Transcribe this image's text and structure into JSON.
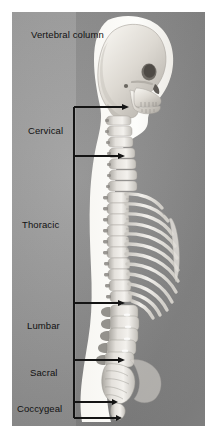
{
  "figure": {
    "title": "Vertebral column",
    "background_left_color": "#9b9b9b",
    "background_right_color": "#8a8a8a",
    "bone_color": "#e8e6e1",
    "silhouette_color": "#fdfdfb",
    "line_color": "#1a1a1a"
  },
  "regions": [
    {
      "key": "cervical",
      "label": "Cervical",
      "vertebrae": 7,
      "bracket_top": 95,
      "bracket_bottom": 144
    },
    {
      "key": "thoracic",
      "label": "Thoracic",
      "vertebrae": 12,
      "bracket_top": 144,
      "bracket_bottom": 291
    },
    {
      "key": "lumbar",
      "label": "Lumbar",
      "vertebrae": 5,
      "bracket_top": 291,
      "bracket_bottom": 348
    },
    {
      "key": "sacral",
      "label": "Sacral",
      "vertebrae": 5,
      "bracket_top": 348,
      "bracket_bottom": 390
    },
    {
      "key": "coccygeal",
      "label": "Coccygeal",
      "vertebrae": 4,
      "bracket_top": 390,
      "bracket_bottom": 406
    }
  ],
  "anatomy": {
    "skull_label": "skull",
    "mandible_label": "mandible",
    "ribcage_label": "rib-cage",
    "sternum_label": "sternum",
    "sacrum_label": "sacrum",
    "coccyx_label": "coccyx"
  }
}
